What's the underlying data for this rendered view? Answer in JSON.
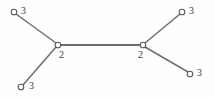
{
  "figure": {
    "type": "graph-diagram",
    "background_color": "#fefefe",
    "edge_color": "#6e6e6e",
    "node_stroke_color": "#5a5a5a",
    "node_fill_color": "#fefefe",
    "label_color": "#3a3a3a"
  },
  "graph_data": {
    "type": "node-link-diagram",
    "nodes": [
      {
        "id": "leaf-top-left",
        "label": "3",
        "x": 14,
        "y": 12,
        "r": 2.8,
        "label_x": 21,
        "label_y": 6,
        "role": "leaf"
      },
      {
        "id": "leaf-bottom-left",
        "label": "3",
        "x": 21,
        "y": 87,
        "r": 2.8,
        "label_x": 29,
        "label_y": 81,
        "role": "leaf"
      },
      {
        "id": "internal-left",
        "label": "2",
        "x": 58,
        "y": 45,
        "r": 2.8,
        "label_x": 59,
        "label_y": 50,
        "role": "internal"
      },
      {
        "id": "internal-right",
        "label": "2",
        "x": 143,
        "y": 45,
        "r": 2.8,
        "label_x": 138,
        "label_y": 50,
        "role": "internal"
      },
      {
        "id": "leaf-top-right",
        "label": "3",
        "x": 182,
        "y": 12,
        "r": 2.8,
        "label_x": 189,
        "label_y": 6,
        "role": "leaf"
      },
      {
        "id": "leaf-bottom-right",
        "label": "3",
        "x": 190,
        "y": 74,
        "r": 2.8,
        "label_x": 197,
        "label_y": 68,
        "role": "leaf"
      }
    ],
    "edges": [
      {
        "id": "edge-tl",
        "from": "leaf-top-left",
        "to": "internal-left",
        "x1": 16,
        "y1": 14,
        "x2": 56,
        "y2": 43,
        "weight": 1
      },
      {
        "id": "edge-bl",
        "from": "leaf-bottom-left",
        "to": "internal-left",
        "x1": 23,
        "y1": 85,
        "x2": 56,
        "y2": 47,
        "weight": 1
      },
      {
        "id": "edge-trunk",
        "from": "internal-left",
        "to": "internal-right",
        "x1": 61,
        "y1": 45,
        "x2": 140,
        "y2": 45,
        "weight": 2
      },
      {
        "id": "edge-tr",
        "from": "internal-right",
        "to": "leaf-top-right",
        "x1": 145,
        "y1": 43,
        "x2": 180,
        "y2": 14,
        "weight": 1
      },
      {
        "id": "edge-br",
        "from": "internal-right",
        "to": "leaf-bottom-right",
        "x1": 145,
        "y1": 47,
        "x2": 188,
        "y2": 72,
        "weight": 1
      }
    ],
    "labels": [
      "3",
      "3",
      "2",
      "2",
      "3",
      "3"
    ]
  }
}
